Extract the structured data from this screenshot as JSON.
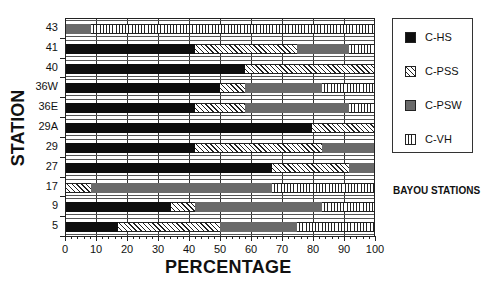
{
  "chart_data": {
    "type": "bar",
    "orientation": "horizontal",
    "stacked": true,
    "title": "",
    "xlabel": "PERCENTAGE",
    "ylabel": "STATION",
    "xlim": [
      0,
      100
    ],
    "xticks": [
      0,
      10,
      20,
      30,
      40,
      50,
      60,
      70,
      80,
      90,
      100
    ],
    "grid": true,
    "legend_position": "right",
    "annotation": "BAYOU STATIONS",
    "categories": [
      "43",
      "41",
      "40",
      "36W",
      "36E",
      "29A",
      "29",
      "27",
      "17",
      "9",
      "5"
    ],
    "series": [
      {
        "name": "C-HS",
        "pattern": "solid-black",
        "values": [
          0,
          42,
          58,
          50,
          42,
          80,
          42,
          67,
          0,
          34,
          17
        ]
      },
      {
        "name": "C-PSS",
        "pattern": "diagonal-hatch",
        "values": [
          0,
          33,
          42,
          8,
          16,
          20,
          41,
          25,
          8,
          8,
          33
        ]
      },
      {
        "name": "C-PSW",
        "pattern": "solid-gray",
        "values": [
          8,
          17,
          0,
          25,
          34,
          0,
          17,
          8,
          59,
          41,
          25
        ]
      },
      {
        "name": "C-VH",
        "pattern": "vertical-hatch",
        "values": [
          92,
          8,
          0,
          17,
          8,
          0,
          0,
          0,
          33,
          17,
          25
        ]
      }
    ]
  },
  "axes": {
    "xlabel": "PERCENTAGE",
    "ylabel": "STATION",
    "xticks": [
      "0",
      "10",
      "20",
      "30",
      "40",
      "50",
      "60",
      "70",
      "80",
      "90",
      "100"
    ]
  },
  "legend": {
    "items": [
      {
        "label": "C-HS",
        "cls": "c-hs"
      },
      {
        "label": "C-PSS",
        "cls": "c-pss"
      },
      {
        "label": "C-PSW",
        "cls": "c-psw"
      },
      {
        "label": "C-VH",
        "cls": "c-vh"
      }
    ]
  },
  "annotation": "BAYOU STATIONS",
  "colors": {
    "c_hs": "#0e0e0e",
    "c_psw": "#6a6a6a",
    "hatch": "#222222"
  }
}
